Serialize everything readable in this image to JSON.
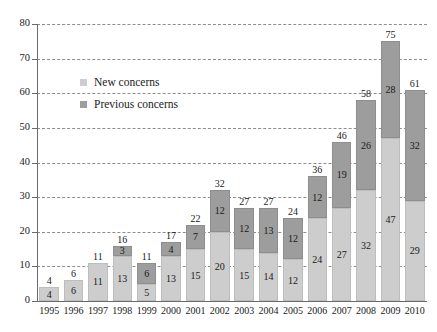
{
  "chart_data": {
    "type": "bar",
    "stacked": true,
    "title": "",
    "subtitle": "",
    "xlabel": "",
    "ylabel": "",
    "ylim": [
      0,
      80
    ],
    "ytick_step": 10,
    "yticks": [
      0,
      10,
      20,
      30,
      40,
      50,
      60,
      70,
      80
    ],
    "grid": true,
    "grid_style": "dashed-horizontal",
    "legend_position": "upper-left-inside",
    "categories": [
      "1995",
      "1996",
      "1997",
      "1998",
      "1999",
      "2000",
      "2001",
      "2002",
      "2003",
      "2004",
      "2005",
      "2006",
      "2007",
      "2008",
      "2009",
      "2010"
    ],
    "series": [
      {
        "name": "New concerns",
        "color": "#cdcdcd",
        "values": [
          4,
          6,
          11,
          13,
          5,
          13,
          15,
          20,
          15,
          14,
          12,
          24,
          27,
          32,
          47,
          29
        ]
      },
      {
        "name": "Previous concerns",
        "color": "#9d9d9d",
        "values": [
          0,
          0,
          0,
          3,
          6,
          4,
          7,
          12,
          12,
          13,
          12,
          12,
          19,
          26,
          28,
          32
        ]
      }
    ],
    "totals": [
      4,
      6,
      11,
      16,
      11,
      17,
      22,
      32,
      27,
      27,
      24,
      36,
      46,
      58,
      75,
      61
    ]
  },
  "legend": {
    "items": [
      {
        "label": "New concerns",
        "swatch": "light-gray-square",
        "color": "#cdcdcd"
      },
      {
        "label": "Previous concerns",
        "swatch": "dark-gray-square",
        "color": "#9d9d9d"
      }
    ]
  },
  "axes": {
    "y_tick_labels": [
      "0",
      "10",
      "20",
      "30",
      "40",
      "50",
      "60",
      "70",
      "80"
    ],
    "x_tick_labels": [
      "1995",
      "1996",
      "1997",
      "1998",
      "1999",
      "2000",
      "2001",
      "2002",
      "2003",
      "2004",
      "2005",
      "2006",
      "2007",
      "2008",
      "2009",
      "2010"
    ]
  },
  "colors": {
    "new_concerns": "#cdcdcd",
    "previous_concerns": "#9d9d9d",
    "axis": "#6a6a6a",
    "grid": "#8d8d8d",
    "text": "#1a1a1a",
    "background": "#ffffff"
  }
}
